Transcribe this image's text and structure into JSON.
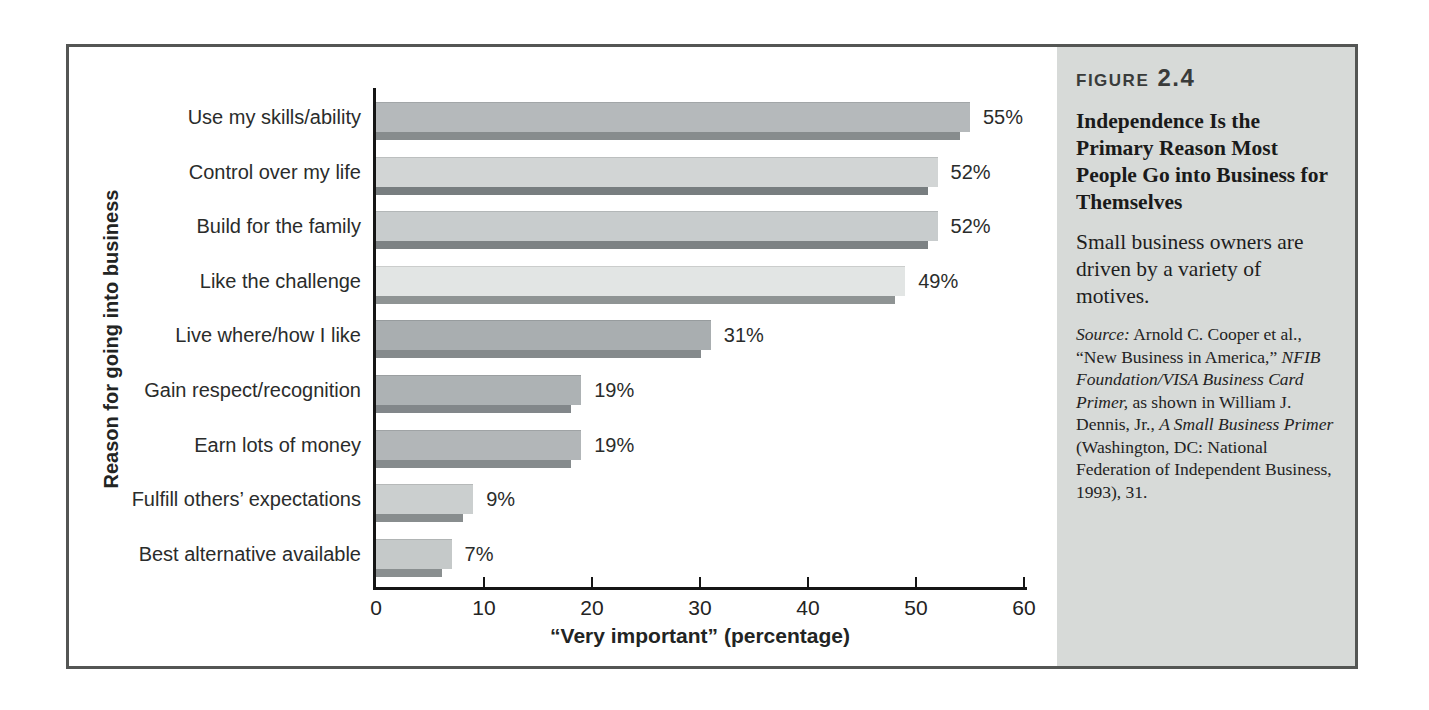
{
  "figure": {
    "label": "Figure 2.4",
    "title": "Independence Is the Primary Reason Most People Go into Business for Themselves",
    "subtitle": "Small business owners are driven by a variety of motives.",
    "source_segments": [
      {
        "text": "Source:",
        "italic": true
      },
      {
        "text": " Arnold C. Cooper et al., “New Business in America,” ",
        "italic": false
      },
      {
        "text": "NFIB Foundation/VISA Business Card Primer,",
        "italic": true
      },
      {
        "text": " as shown in William J. Dennis, Jr., ",
        "italic": false
      },
      {
        "text": "A Small Business Primer",
        "italic": true
      },
      {
        "text": " (Washington, DC: National Federation of Independent Business, 1993), 31.",
        "italic": false
      }
    ]
  },
  "chart_data": {
    "type": "bar",
    "orientation": "horizontal",
    "title": "",
    "xlabel": "“Very important” (percentage)",
    "ylabel": "Reason for going into business",
    "xlim": [
      0,
      60
    ],
    "xticks": [
      0,
      10,
      20,
      30,
      40,
      50,
      60
    ],
    "grid": false,
    "legend": false,
    "categories": [
      "Use my skills/ability",
      "Control over my life",
      "Build for the family",
      "Like the challenge",
      "Live where/how I like",
      "Gain respect/recognition",
      "Earn lots of money",
      "Fulfill others’ expectations",
      "Best alternative available"
    ],
    "values": [
      55,
      52,
      52,
      49,
      31,
      19,
      19,
      9,
      7
    ],
    "value_labels": [
      "55%",
      "52%",
      "52%",
      "49%",
      "31%",
      "19%",
      "19%",
      "9%",
      "7%"
    ],
    "bar_colors": [
      "#b5b9bb",
      "#d2d5d5",
      "#c8cccd",
      "#e2e5e4",
      "#a9aeb0",
      "#adb2b4",
      "#b2b6b8",
      "#cbcfcf",
      "#c5c9c9"
    ],
    "shadow_colors": [
      "#878c8d",
      "#787e80",
      "#7d8284",
      "#8f9494",
      "#858a8c",
      "#82878a",
      "#868b8d",
      "#888d8e",
      "#8a8f90"
    ]
  },
  "colors": {
    "frame_border": "#545654",
    "sidebar_bg": "#d7dad8",
    "axis": "#151515",
    "text": "#2a2c2b"
  }
}
